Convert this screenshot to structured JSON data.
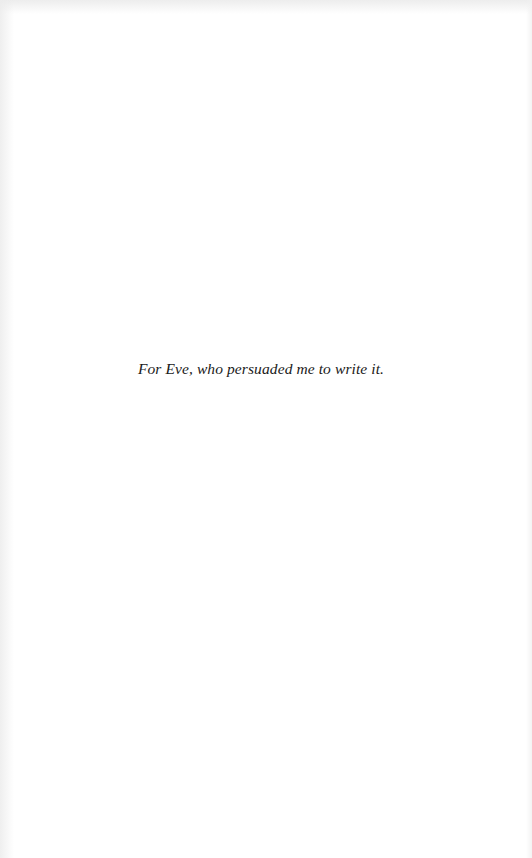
{
  "page": {
    "dedication": "For Eve, who persuaded me to write it."
  }
}
